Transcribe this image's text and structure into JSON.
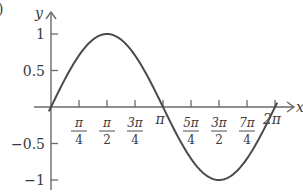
{
  "panel_label_fragment": ")",
  "chart_data": {
    "type": "line",
    "title": "",
    "function": "y = sin x",
    "xlabel": "x",
    "ylabel": "y",
    "xlim": [
      0,
      6.2832
    ],
    "ylim": [
      -1,
      1
    ],
    "grid": false,
    "legend": null,
    "x_ticks": [
      {
        "value": 0.7854,
        "num": "π",
        "den": "4"
      },
      {
        "value": 1.5708,
        "num": "π",
        "den": "2"
      },
      {
        "value": 2.3562,
        "num": "3π",
        "den": "4"
      },
      {
        "value": 3.1416,
        "num": "π",
        "den": ""
      },
      {
        "value": 3.927,
        "num": "5π",
        "den": "4"
      },
      {
        "value": 4.7124,
        "num": "3π",
        "den": "2"
      },
      {
        "value": 5.4978,
        "num": "7π",
        "den": "4"
      },
      {
        "value": 6.2832,
        "num": "2π",
        "den": ""
      }
    ],
    "y_ticks": [
      {
        "value": 1,
        "label": "1"
      },
      {
        "value": 0.5,
        "label": "0.5"
      },
      {
        "value": -0.5,
        "label": "−0.5"
      },
      {
        "value": -1,
        "label": "−1"
      }
    ],
    "series": [
      {
        "name": "sin x",
        "x": [
          0,
          0.7854,
          1.5708,
          2.3562,
          3.1416,
          3.927,
          4.7124,
          5.4978,
          6.2832
        ],
        "y": [
          0,
          0.7071,
          1,
          0.7071,
          0,
          -0.7071,
          -1,
          -0.7071,
          0
        ]
      }
    ],
    "colors": {
      "curve": "#4a4a4a",
      "axis": "#6a6a6a",
      "text": "#3a3a3a"
    }
  }
}
